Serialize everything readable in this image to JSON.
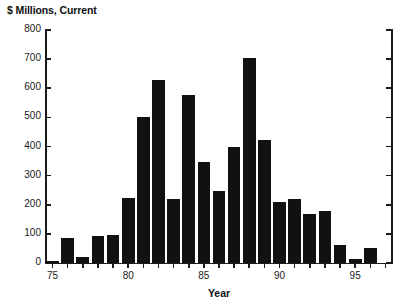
{
  "chart_data": {
    "type": "bar",
    "title": "",
    "ylabel": "$ Millions, Current",
    "xlabel": "Year",
    "categories": [
      "75",
      "76",
      "77",
      "78",
      "79",
      "80",
      "81",
      "82",
      "83",
      "84",
      "85",
      "86",
      "87",
      "88",
      "89",
      "90",
      "91",
      "92",
      "93",
      "94",
      "95",
      "96",
      "97"
    ],
    "values": [
      8,
      85,
      22,
      92,
      95,
      222,
      502,
      630,
      220,
      577,
      348,
      248,
      400,
      705,
      422,
      210,
      220,
      168,
      180,
      62,
      15,
      50,
      0
    ],
    "ylim": [
      0,
      800
    ],
    "ytick_labels": [
      "0",
      "100",
      "200",
      "300",
      "400",
      "500",
      "600",
      "700",
      "800"
    ],
    "ytick_values": [
      0,
      100,
      200,
      300,
      400,
      500,
      600,
      700,
      800
    ],
    "xtick_labels": [
      "75",
      "80",
      "85",
      "90",
      "95"
    ],
    "xtick_categories": [
      "75",
      "80",
      "85",
      "90",
      "95"
    ],
    "grid": false,
    "legend": null,
    "bar_color": "#111111",
    "axis_color": "#1a1a1a",
    "background_color": "#ffffff"
  }
}
